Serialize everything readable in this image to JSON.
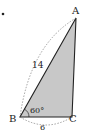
{
  "figure": {
    "type": "triangle",
    "vertices": {
      "A": "A",
      "B": "B",
      "C": "C"
    },
    "side_AB_label": "14",
    "side_BC_label": "6",
    "angle_B_label": "60°",
    "fill_color": "#c8c8c8",
    "stroke_color": "#222222"
  }
}
